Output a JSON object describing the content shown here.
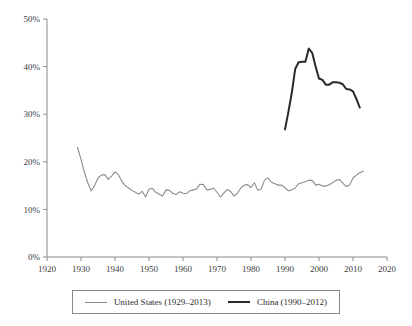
{
  "chart_data": {
    "type": "line",
    "title": "",
    "subtitle": "",
    "xlabel": "",
    "ylabel": "",
    "xlim": [
      1920,
      2020
    ],
    "ylim": [
      0,
      50
    ],
    "grid": false,
    "legend_position": "bottom",
    "x_tick_labels": [
      "1920",
      "1930",
      "1940",
      "1950",
      "1960",
      "1970",
      "1980",
      "1990",
      "2000",
      "2010",
      "2020"
    ],
    "x_ticks": [
      1920,
      1930,
      1940,
      1950,
      1960,
      1970,
      1980,
      1990,
      2000,
      2010,
      2020
    ],
    "y_tick_labels": [
      "0%",
      "10%",
      "20%",
      "30%",
      "40%",
      "50%"
    ],
    "y_ticks": [
      0,
      10,
      20,
      30,
      40,
      50
    ],
    "series": [
      {
        "name": "United States (1929–2013)",
        "color": "#8c8c8c",
        "width": 1.1,
        "x": [
          1929,
          1930,
          1931,
          1932,
          1933,
          1934,
          1935,
          1936,
          1937,
          1938,
          1939,
          1940,
          1941,
          1942,
          1943,
          1944,
          1945,
          1946,
          1947,
          1948,
          1949,
          1950,
          1951,
          1952,
          1953,
          1954,
          1955,
          1956,
          1957,
          1958,
          1959,
          1960,
          1961,
          1962,
          1963,
          1964,
          1965,
          1966,
          1967,
          1968,
          1969,
          1970,
          1971,
          1972,
          1973,
          1974,
          1975,
          1976,
          1977,
          1978,
          1979,
          1980,
          1981,
          1982,
          1983,
          1984,
          1985,
          1986,
          1987,
          1988,
          1989,
          1990,
          1991,
          1992,
          1993,
          1994,
          1995,
          1996,
          1997,
          1998,
          1999,
          2000,
          2001,
          2002,
          2003,
          2004,
          2005,
          2006,
          2007,
          2008,
          2009,
          2010,
          2011,
          2012,
          2013
        ],
        "values": [
          23.0,
          20.5,
          17.8,
          15.6,
          13.9,
          15.0,
          16.6,
          17.2,
          17.3,
          16.3,
          17.0,
          17.9,
          17.3,
          15.9,
          15.0,
          14.5,
          14.0,
          13.6,
          13.2,
          13.8,
          12.6,
          14.3,
          14.4,
          13.6,
          13.2,
          12.8,
          14.1,
          14.0,
          13.4,
          13.1,
          13.7,
          13.4,
          13.3,
          13.9,
          14.1,
          14.3,
          15.3,
          15.2,
          14.1,
          14.2,
          14.5,
          13.6,
          12.6,
          13.4,
          14.2,
          13.8,
          12.8,
          13.4,
          14.5,
          15.1,
          15.2,
          14.6,
          15.6,
          14.0,
          14.3,
          16.2,
          16.6,
          15.7,
          15.4,
          15.1,
          15.1,
          14.6,
          13.9,
          14.1,
          14.5,
          15.4,
          15.6,
          15.8,
          16.1,
          16.1,
          15.1,
          15.3,
          14.9,
          14.9,
          15.2,
          15.6,
          16.1,
          16.3,
          15.5,
          14.8,
          15.1,
          16.6,
          17.2,
          17.7,
          18.0
        ]
      },
      {
        "name": "China (1990–2012)",
        "color": "#2a2a2a",
        "width": 2.0,
        "x": [
          1990,
          1991,
          1992,
          1993,
          1994,
          1995,
          1996,
          1997,
          1998,
          1999,
          2000,
          2001,
          2002,
          2003,
          2004,
          2005,
          2006,
          2007,
          2008,
          2009,
          2010,
          2011,
          2012
        ],
        "values": [
          26.8,
          30.5,
          34.5,
          39.5,
          40.9,
          41.0,
          41.0,
          43.8,
          42.9,
          40.0,
          37.5,
          37.2,
          36.2,
          36.2,
          36.7,
          36.7,
          36.6,
          36.3,
          35.3,
          35.2,
          34.8,
          33.2,
          31.4
        ]
      }
    ]
  },
  "legend": {
    "items": [
      {
        "label": "United States (1929–2013)"
      },
      {
        "label": "China (1990–2012)"
      }
    ]
  }
}
